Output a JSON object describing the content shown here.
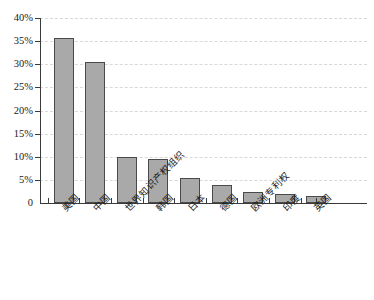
{
  "chart_data": {
    "type": "bar",
    "title": "",
    "subtitle": "",
    "xlabel": "",
    "ylabel": "",
    "categories": [
      "美国",
      "中国",
      "世界知识产权组织",
      "韩国",
      "日本",
      "德国",
      "欧洲专利权",
      "印度",
      "英国"
    ],
    "values": [
      35.7,
      30.5,
      10.0,
      9.5,
      5.5,
      4.0,
      2.3,
      2.0,
      1.5
    ],
    "ylim": [
      0,
      40
    ],
    "ytick_values": [
      0,
      5,
      10,
      15,
      20,
      25,
      30,
      35,
      40
    ],
    "ytick_labels": [
      "0",
      "5%",
      "10%",
      "15%",
      "20%",
      "25%",
      "30%",
      "35%",
      "40%"
    ],
    "grid": true,
    "grid_axis": "y",
    "legend": false,
    "legend_position": "none",
    "bar_color": "#a9a9a9",
    "bar_border_color": "#4a4a4a",
    "gridline_color": "#d8d8d8",
    "axis_color": "#3a3a3a",
    "background_color": "#ffffff"
  }
}
